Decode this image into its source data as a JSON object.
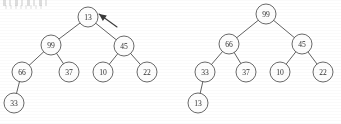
{
  "figure": {
    "background_color": "#ffffff",
    "stroke_color": "#58585a",
    "text_color": "#2e2e30",
    "node_radius": 10,
    "canvas": {
      "width": 341,
      "height": 124
    }
  },
  "trees": [
    {
      "id": "left-tree",
      "name": "tree-before",
      "root_value": "13",
      "nodes": [
        {
          "id": "L0",
          "label": "13",
          "cx": 88,
          "cy": 17,
          "depth": 0
        },
        {
          "id": "L1",
          "label": "99",
          "cx": 51,
          "cy": 45,
          "depth": 1
        },
        {
          "id": "L2",
          "label": "45",
          "cx": 124,
          "cy": 46,
          "depth": 1
        },
        {
          "id": "L3",
          "label": "66",
          "cx": 22,
          "cy": 72,
          "depth": 2
        },
        {
          "id": "L4",
          "label": "37",
          "cx": 69,
          "cy": 72,
          "depth": 2
        },
        {
          "id": "L5",
          "label": "10",
          "cx": 103,
          "cy": 72,
          "depth": 2
        },
        {
          "id": "L6",
          "label": "22",
          "cx": 147,
          "cy": 72,
          "depth": 2
        },
        {
          "id": "L7",
          "label": "33",
          "cx": 14,
          "cy": 103,
          "depth": 3
        }
      ],
      "edges": [
        {
          "from": "L0",
          "to": "L1"
        },
        {
          "from": "L0",
          "to": "L2"
        },
        {
          "from": "L1",
          "to": "L3"
        },
        {
          "from": "L1",
          "to": "L4"
        },
        {
          "from": "L2",
          "to": "L5"
        },
        {
          "from": "L2",
          "to": "L6"
        },
        {
          "from": "L3",
          "to": "L7"
        }
      ]
    },
    {
      "id": "right-tree",
      "name": "tree-after",
      "root_value": "99",
      "nodes": [
        {
          "id": "R0",
          "label": "99",
          "cx": 266,
          "cy": 14,
          "depth": 0
        },
        {
          "id": "R1",
          "label": "66",
          "cx": 229,
          "cy": 44,
          "depth": 1
        },
        {
          "id": "R2",
          "label": "45",
          "cx": 302,
          "cy": 44,
          "depth": 1
        },
        {
          "id": "R3",
          "label": "33",
          "cx": 205,
          "cy": 72,
          "depth": 2
        },
        {
          "id": "R4",
          "label": "37",
          "cx": 246,
          "cy": 72,
          "depth": 2
        },
        {
          "id": "R5",
          "label": "10",
          "cx": 280,
          "cy": 72,
          "depth": 2
        },
        {
          "id": "R6",
          "label": "22",
          "cx": 323,
          "cy": 72,
          "depth": 2
        },
        {
          "id": "R7",
          "label": "13",
          "cx": 198,
          "cy": 103,
          "depth": 3
        }
      ],
      "edges": [
        {
          "from": "R0",
          "to": "R1"
        },
        {
          "from": "R0",
          "to": "R2"
        },
        {
          "from": "R1",
          "to": "R3"
        },
        {
          "from": "R1",
          "to": "R4"
        },
        {
          "from": "R2",
          "to": "R5"
        },
        {
          "from": "R2",
          "to": "R6"
        },
        {
          "from": "R3",
          "to": "R7"
        }
      ]
    }
  ],
  "annotations": [
    {
      "id": "root-pointer",
      "name": "root-pointer-arrow",
      "target_node": "L0",
      "target_label": "13",
      "tail_x": 117,
      "tail_y": 27,
      "tip_x": 99,
      "tip_y": 14,
      "text": ""
    }
  ]
}
